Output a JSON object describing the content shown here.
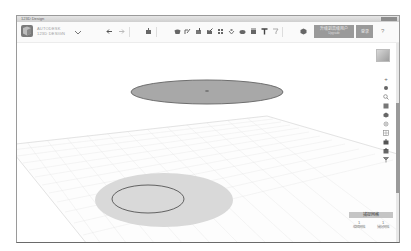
{
  "window": {
    "title": "123D Design"
  },
  "toolbar": {
    "app_name_line1": "AUTODESK",
    "app_name_line2": "123D DESIGN",
    "undo_icon": "undo-arrow-icon",
    "redo_icon": "redo-arrow-icon",
    "tools": [
      {
        "name": "transform-icon"
      },
      {
        "name": "primitives-icon"
      },
      {
        "name": "sketch-icon"
      },
      {
        "name": "construct-icon"
      },
      {
        "name": "modify-icon"
      },
      {
        "name": "pattern-icon"
      },
      {
        "name": "grouping-icon"
      },
      {
        "name": "combine-icon"
      },
      {
        "name": "measure-icon"
      },
      {
        "name": "text-icon"
      },
      {
        "name": "snap-icon"
      },
      {
        "name": "material-icon"
      }
    ],
    "upgrade_label_line1": "升级到高级用户",
    "upgrade_label_line2": "Upgrade",
    "login_label": "登录",
    "help_label": "?"
  },
  "viewport": {
    "navigation": [
      {
        "name": "pan-icon",
        "glyph": "+"
      },
      {
        "name": "orbit-icon",
        "glyph": "✥"
      },
      {
        "name": "zoom-icon",
        "glyph": "🔍"
      },
      {
        "name": "fit-icon",
        "glyph": "▣"
      },
      {
        "name": "view-icon",
        "glyph": "◈"
      },
      {
        "name": "visibility-icon",
        "glyph": "◉"
      },
      {
        "name": "grid-icon",
        "glyph": "▦"
      },
      {
        "name": "camera-icon",
        "glyph": "◘"
      },
      {
        "name": "material-display-icon",
        "glyph": "◆"
      },
      {
        "name": "model-display-icon",
        "glyph": "✇"
      }
    ],
    "scene": {
      "upper_disk_color": "#a8a8a8",
      "upper_disk_outline": "#6e6e6e",
      "shadow_color": "#d9d9d9",
      "circle_outline": "#555555",
      "grid_color": "#e6e6e6"
    }
  },
  "snap_grid": {
    "title": "捕捉网格",
    "columns": [
      {
        "value": "1",
        "label": "编辑网格"
      },
      {
        "value": "1",
        "label": "捕捉网格"
      }
    ]
  }
}
